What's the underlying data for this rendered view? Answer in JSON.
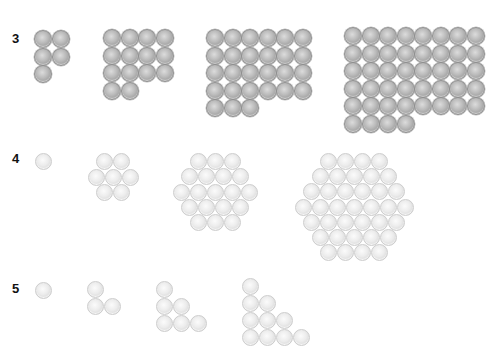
{
  "rows": [
    {
      "label": "3",
      "label_pos": [
        12,
        31
      ],
      "style": "dark",
      "description": "Rectangular grid arrangements (row-filled)",
      "groups": [
        {
          "count": 5,
          "cols": 2,
          "origin": [
            34,
            30
          ],
          "step": 17.5,
          "row_counts": [
            2,
            2,
            1
          ]
        },
        {
          "count": 14,
          "cols": 4,
          "origin": [
            103,
            29
          ],
          "step": 17.5,
          "row_counts": [
            4,
            4,
            4,
            2
          ]
        },
        {
          "count": 27,
          "cols": 6,
          "origin": [
            206,
            29
          ],
          "step": 17.5,
          "row_counts": [
            6,
            6,
            6,
            6,
            3
          ]
        },
        {
          "count": 44,
          "cols": 8,
          "origin": [
            344,
            27
          ],
          "step": 17.5,
          "row_counts": [
            8,
            8,
            8,
            8,
            8,
            4
          ]
        }
      ]
    },
    {
      "label": "4",
      "label_pos": [
        12,
        151
      ],
      "style": "light",
      "description": "Centered hexagonal numbers",
      "groups": [
        {
          "count": 1,
          "center": [
            43,
            161
          ],
          "row_counts": [
            1
          ]
        },
        {
          "count": 7,
          "center": [
            113,
            177
          ],
          "row_counts": [
            2,
            3,
            2
          ]
        },
        {
          "count": 19,
          "center": [
            215,
            192
          ],
          "row_counts": [
            3,
            4,
            5,
            4,
            3
          ]
        },
        {
          "count": 37,
          "center": [
            354,
            207
          ],
          "row_counts": [
            4,
            5,
            6,
            7,
            6,
            5,
            4
          ]
        }
      ]
    },
    {
      "label": "5",
      "label_pos": [
        12,
        281
      ],
      "style": "light",
      "description": "Triangular staircase arrangements (clipped at bottom)",
      "groups": [
        {
          "count": 1,
          "origin": [
            35,
            282
          ],
          "row_counts": [
            1
          ]
        },
        {
          "count": 3,
          "origin": [
            87,
            281
          ],
          "row_counts": [
            1,
            2
          ]
        },
        {
          "count": 6,
          "origin": [
            156,
            281
          ],
          "row_counts": [
            1,
            2,
            3
          ]
        },
        {
          "count": 10,
          "origin": [
            242,
            278
          ],
          "row_counts": [
            1,
            2,
            3,
            4
          ]
        }
      ]
    }
  ],
  "colors": {
    "background": "#ffffff",
    "dark_ball": "#b0b0b0",
    "light_ball": "#e6e6e6",
    "label": "#111111"
  }
}
